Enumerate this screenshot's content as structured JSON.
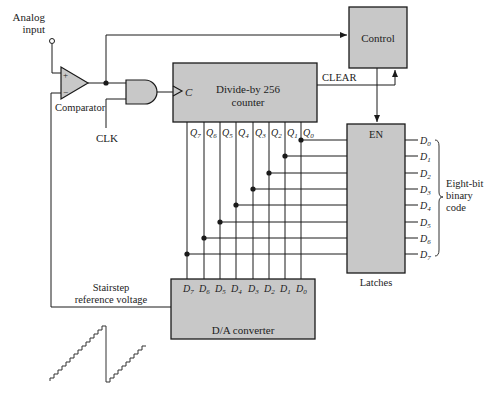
{
  "diagram": {
    "inputs": {
      "analog_input": [
        "Analog",
        "input"
      ],
      "clk": "CLK"
    },
    "blocks": {
      "comparator": {
        "label": "Comparator",
        "plus": "+",
        "minus": "−"
      },
      "control": {
        "label": "Control"
      },
      "counter": {
        "line1": "Divide-by 256",
        "line2": "counter",
        "clock_pin": "C"
      },
      "latches": {
        "label": "Latches",
        "enable": "EN"
      },
      "dac": {
        "label": "D/A converter"
      }
    },
    "signals": {
      "clear": "CLEAR",
      "stairstep": [
        "Stairstep",
        "reference voltage"
      ],
      "output_group": [
        "Eight-bit",
        "binary",
        "code"
      ]
    },
    "counter_outputs": [
      {
        "name": "Q",
        "sub": "7"
      },
      {
        "name": "Q",
        "sub": "6"
      },
      {
        "name": "Q",
        "sub": "5"
      },
      {
        "name": "Q",
        "sub": "4"
      },
      {
        "name": "Q",
        "sub": "3"
      },
      {
        "name": "Q",
        "sub": "2"
      },
      {
        "name": "Q",
        "sub": "1"
      },
      {
        "name": "Q",
        "sub": "0"
      }
    ],
    "dac_inputs": [
      {
        "name": "D",
        "sub": "7"
      },
      {
        "name": "D",
        "sub": "6"
      },
      {
        "name": "D",
        "sub": "5"
      },
      {
        "name": "D",
        "sub": "4"
      },
      {
        "name": "D",
        "sub": "3"
      },
      {
        "name": "D",
        "sub": "2"
      },
      {
        "name": "D",
        "sub": "1"
      },
      {
        "name": "D",
        "sub": "0"
      }
    ],
    "latch_outputs": [
      {
        "name": "D",
        "sub": "0"
      },
      {
        "name": "D",
        "sub": "1"
      },
      {
        "name": "D",
        "sub": "2"
      },
      {
        "name": "D",
        "sub": "3"
      },
      {
        "name": "D",
        "sub": "4"
      },
      {
        "name": "D",
        "sub": "5"
      },
      {
        "name": "D",
        "sub": "6"
      },
      {
        "name": "D",
        "sub": "7"
      }
    ],
    "colors": {
      "block_fill": "#c8c8c8",
      "stroke": "#1a1a1a",
      "text": "#222222"
    }
  }
}
